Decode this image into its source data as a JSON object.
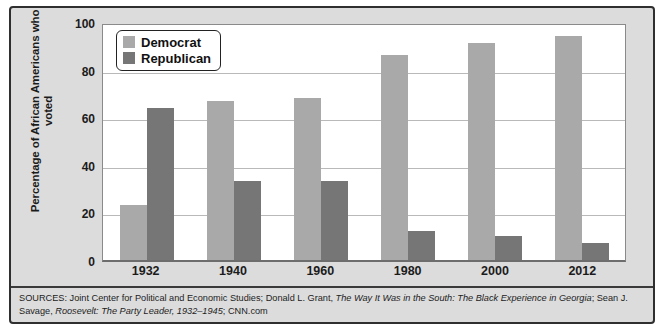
{
  "chart_data": {
    "type": "bar",
    "title": "",
    "xlabel": "",
    "ylabel": "Percentage of African Americans who voted",
    "categories": [
      "1932",
      "1940",
      "1960",
      "1980",
      "2000",
      "2012"
    ],
    "series": [
      {
        "name": "Democrat",
        "color": "#a9a9a9",
        "values": [
          23,
          67,
          68,
          86,
          91,
          94
        ]
      },
      {
        "name": "Republican",
        "color": "#767676",
        "values": [
          64,
          33,
          33,
          12,
          10,
          7
        ]
      }
    ],
    "ylim": [
      0,
      100
    ],
    "yticks": [
      "0",
      "20",
      "40",
      "60",
      "80",
      "100"
    ],
    "grid": true,
    "legend_position": "top-left"
  },
  "legend": {
    "items": [
      {
        "label": "Democrat",
        "swatch": "dem"
      },
      {
        "label": "Republican",
        "swatch": "rep"
      }
    ]
  },
  "sources": {
    "prefix": "SOURCES: Joint Center for Political and Economic Studies; Donald L. Grant, ",
    "title1": "The Way It Was in the South: The Black Experience in Georgia",
    "middle": "; Sean J. Savage, ",
    "title2": "Roosevelt: The Party Leader, 1932–1945",
    "suffix": "; CNN.com"
  }
}
